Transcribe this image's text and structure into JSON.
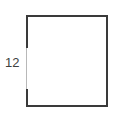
{
  "diagram": {
    "shape": "rectangle",
    "side_label": "12",
    "side_label_position": "left",
    "stroke_color": "#3a3a3a",
    "label_color": "#404040"
  }
}
